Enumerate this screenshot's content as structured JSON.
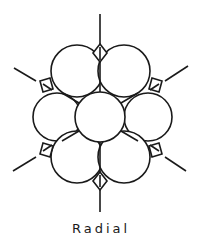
{
  "diagram": {
    "caption": "Radial",
    "stroke_color": "#1a1a1a",
    "background": "#ffffff",
    "center_circle": {
      "cx": 100,
      "cy": 117,
      "r": 25
    },
    "outer_circles": [
      {
        "cx": 77,
        "cy": 71,
        "r": 26
      },
      {
        "cx": 124,
        "cy": 71,
        "r": 26
      },
      {
        "cx": 57,
        "cy": 117,
        "r": 24
      },
      {
        "cx": 148,
        "cy": 117,
        "r": 24
      },
      {
        "cx": 77,
        "cy": 157,
        "r": 26
      },
      {
        "cx": 124,
        "cy": 157,
        "r": 26
      }
    ],
    "spokes": [
      {
        "x1": 100,
        "y1": 14,
        "x2": 100,
        "y2": 44
      },
      {
        "x1": 100,
        "y1": 190,
        "x2": 100,
        "y2": 212
      },
      {
        "x1": 14,
        "y1": 68,
        "x2": 36,
        "y2": 81
      },
      {
        "x1": 188,
        "y1": 66,
        "x2": 165,
        "y2": 81
      },
      {
        "x1": 13,
        "y1": 171,
        "x2": 36,
        "y2": 157
      },
      {
        "x1": 186,
        "y1": 171,
        "x2": 165,
        "y2": 157
      }
    ]
  }
}
